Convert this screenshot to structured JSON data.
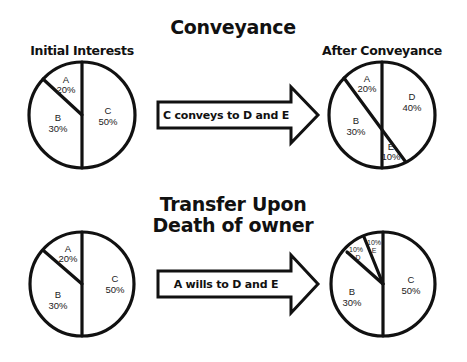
{
  "sections": [
    {
      "title": "Conveyance",
      "before": {
        "label": "Initial Interests",
        "slices": [
          {
            "owner": "A",
            "percent": "20%"
          },
          {
            "owner": "B",
            "percent": "30%"
          },
          {
            "owner": "C",
            "percent": "50%"
          }
        ]
      },
      "action": "C conveys to D and E",
      "after": {
        "label": "After Conveyance",
        "slices": [
          {
            "owner": "A",
            "percent": "20%"
          },
          {
            "owner": "B",
            "percent": "30%"
          },
          {
            "owner": "D",
            "percent": "40%"
          },
          {
            "owner": "E",
            "percent": "10%"
          }
        ]
      }
    },
    {
      "title_line1": "Transfer Upon",
      "title_line2": "Death of owner",
      "before": {
        "slices": [
          {
            "owner": "A",
            "percent": "20%"
          },
          {
            "owner": "B",
            "percent": "30%"
          },
          {
            "owner": "C",
            "percent": "50%"
          }
        ]
      },
      "action": "A wills to D and E",
      "after": {
        "slices": [
          {
            "owner": "D",
            "percent": "10%"
          },
          {
            "owner": "E",
            "percent": "10%"
          },
          {
            "owner": "B",
            "percent": "30%"
          },
          {
            "owner": "C",
            "percent": "50%"
          }
        ]
      }
    }
  ],
  "colors": {
    "ink": "#111111",
    "background": "#ffffff"
  }
}
